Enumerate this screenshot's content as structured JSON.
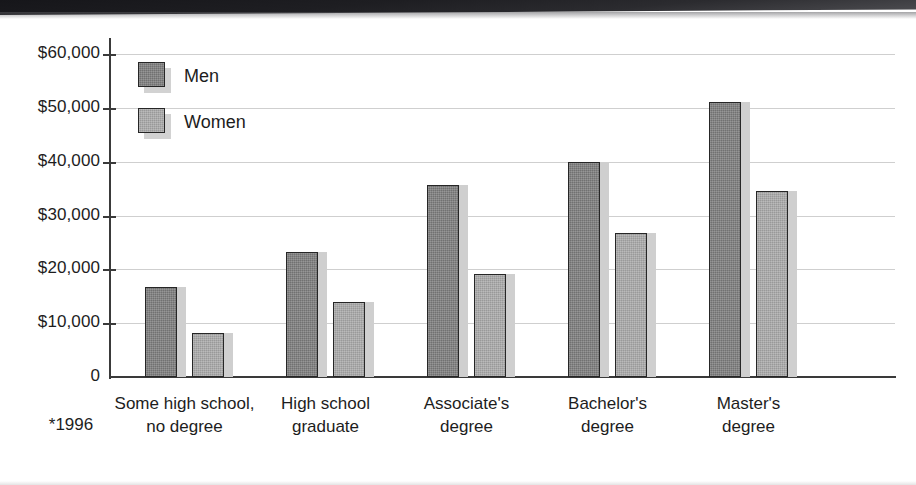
{
  "chart_data": {
    "type": "bar",
    "title": "",
    "xlabel": "",
    "ylabel": "",
    "ylim": [
      0,
      60000
    ],
    "grid": true,
    "legend_position": "inside-top-left",
    "categories": [
      "Some high school, no degree",
      "High school graduate",
      "Associate's degree",
      "Bachelor's degree",
      "Master's degree"
    ],
    "category_lines": [
      [
        "Some high school,",
        "no degree"
      ],
      [
        "High school",
        "graduate"
      ],
      [
        "Associate's",
        "degree"
      ],
      [
        "Bachelor's",
        "degree"
      ],
      [
        "Master's",
        "degree"
      ]
    ],
    "series": [
      {
        "name": "Men",
        "color": "#7d7d7d",
        "values": [
          16800,
          23200,
          35700,
          40000,
          51000
        ]
      },
      {
        "name": "Women",
        "color": "#a6a6a6",
        "values": [
          8200,
          14000,
          19200,
          26700,
          34600
        ]
      }
    ],
    "ytick_values": [
      60000,
      50000,
      40000,
      30000,
      20000,
      10000,
      0
    ],
    "ytick_labels": [
      "$60,000",
      "$50,000",
      "$40,000",
      "$30,000",
      "$20,000",
      "$10,000",
      "0"
    ],
    "annotations": [
      "*1996"
    ]
  },
  "legend": {
    "items": [
      {
        "label": "Men"
      },
      {
        "label": "Women"
      }
    ]
  },
  "footnote": "*1996",
  "colors": {
    "men_bar": "#7d7d7d",
    "women_bar": "#a6a6a6",
    "bar_outline": "#262626",
    "gridline": "#cfcfcf",
    "axis": "#3a3a3a",
    "shadow": "#cfcfcf",
    "text": "#1d1d1d",
    "background": "#ffffff"
  }
}
